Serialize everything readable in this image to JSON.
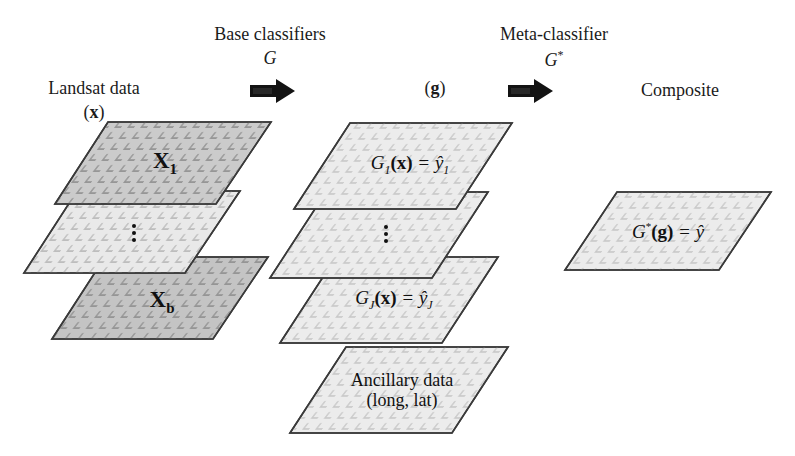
{
  "figure": {
    "width": 795,
    "height": 456,
    "background": "#ffffff"
  },
  "headers": {
    "base_classifiers": "Base classifiers",
    "base_classifiers_symbol": "G",
    "meta_classifier": "Meta-classifier",
    "meta_classifier_symbol": "G",
    "meta_classifier_symbol_sup": "*"
  },
  "columns": {
    "input": {
      "title": "Landsat data",
      "symbol_open": "(",
      "symbol": "x",
      "symbol_close": ")"
    },
    "intermediate": {
      "symbol_open": "(",
      "symbol": "g",
      "symbol_close": ")"
    },
    "output": {
      "title": "Composite"
    }
  },
  "arrows": [
    {
      "name": "base-classifier-arrow",
      "label": ""
    },
    {
      "name": "meta-classifier-arrow",
      "label": ""
    }
  ],
  "input_stack": {
    "layers": [
      {
        "id": "x1",
        "label_main": "X",
        "label_sub": "1",
        "fill": "#c9c9c9"
      },
      {
        "id": "xdots",
        "label_main": "",
        "label_sub": "",
        "fill": "#e8e8e8",
        "dots": "vertical-ellipsis"
      },
      {
        "id": "xb",
        "label_main": "X",
        "label_sub": "b",
        "fill": "#c4c4c4"
      }
    ]
  },
  "middle_stack": {
    "layers": [
      {
        "id": "g1",
        "formula": "G",
        "sub1": "1",
        "args": "(x)",
        "eq": "=",
        "yhat": "ŷ",
        "sub2": "1",
        "fill": "#ececec"
      },
      {
        "id": "gdots",
        "formula": "",
        "fill": "#ececec",
        "dots": "vertical-ellipsis"
      },
      {
        "id": "gj",
        "formula": "G",
        "sub1": "J",
        "args": "(x)",
        "eq": "=",
        "yhat": "ŷ",
        "sub2": "J",
        "fill": "#ececec"
      }
    ],
    "ancillary": {
      "id": "ancillary",
      "line1": "Ancillary data",
      "line2": "(long, lat)",
      "fill": "#ececec"
    }
  },
  "output_stack": {
    "layer": {
      "id": "composite",
      "formula": "G",
      "star": "*",
      "args": "(g)",
      "eq": "=",
      "yhat": "ŷ",
      "fill": "#ececec"
    }
  },
  "style": {
    "stroke": "#2b2b2b",
    "texture_mark": "corner-tick",
    "text_color": "#1a1a1a"
  }
}
